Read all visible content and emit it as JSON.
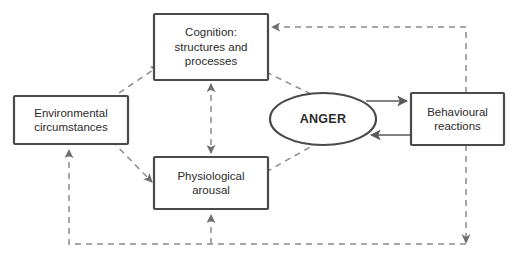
{
  "diagram": {
    "style": {
      "node_stroke": "#4a4a4a",
      "node_fill": "#ffffff",
      "text_color": "#2b2b2b",
      "solid_edge_color": "#5a5a5a",
      "dashed_edge_color": "#8c8c8c",
      "background": "#ffffff"
    },
    "nodes": [
      {
        "id": "cognition",
        "shape": "rectangle",
        "label": "Cognition:\nstructures and\nprocesses",
        "x": 154,
        "y": 14,
        "width": 114,
        "height": 66
      },
      {
        "id": "environment",
        "shape": "rectangle",
        "label": "Environmental\ncircumstances",
        "x": 14,
        "y": 96,
        "width": 114,
        "height": 48
      },
      {
        "id": "physiology",
        "shape": "rectangle",
        "label": "Physiological\narousal",
        "x": 154,
        "y": 157,
        "width": 114,
        "height": 52
      },
      {
        "id": "anger",
        "shape": "ellipse",
        "label": "ANGER",
        "emphasis": true,
        "x": 270,
        "y": 93,
        "width": 106,
        "height": 52
      },
      {
        "id": "behaviour",
        "shape": "rectangle",
        "label": "Behavioural\nreactions",
        "x": 411,
        "y": 93,
        "width": 93,
        "height": 52
      }
    ],
    "edges": [
      {
        "id": "environment-to-cognition",
        "from": "environment",
        "to": "cognition",
        "style": "dashed",
        "arrow": "single"
      },
      {
        "id": "environment-to-physiology",
        "from": "environment",
        "to": "physiology",
        "style": "dashed",
        "arrow": "single"
      },
      {
        "id": "cognition-physiology",
        "from": "cognition",
        "to": "physiology",
        "style": "dashed",
        "arrow": "double"
      },
      {
        "id": "cognition-to-anger",
        "from": "cognition",
        "to": "anger",
        "style": "dashed",
        "arrow": "none"
      },
      {
        "id": "physiology-to-anger",
        "from": "physiology",
        "to": "anger",
        "style": "dashed",
        "arrow": "none"
      },
      {
        "id": "anger-to-behaviour",
        "from": "anger",
        "to": "behaviour",
        "style": "solid",
        "arrow": "single"
      },
      {
        "id": "behaviour-to-anger",
        "from": "behaviour",
        "to": "anger",
        "style": "solid",
        "arrow": "single"
      },
      {
        "id": "behaviour-to-cognition",
        "from": "behaviour",
        "to": "cognition",
        "style": "dashed",
        "arrow": "single"
      },
      {
        "id": "behaviour-to-environment",
        "from": "behaviour",
        "to": "environment",
        "style": "dashed",
        "arrow": "single"
      },
      {
        "id": "behaviour-to-physiology",
        "from": "behaviour",
        "to": "physiology",
        "style": "dashed",
        "arrow": "single"
      }
    ]
  }
}
